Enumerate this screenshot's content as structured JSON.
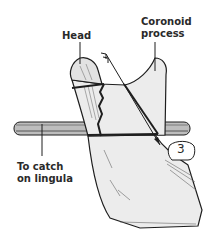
{
  "figure": {
    "labels": {
      "head": "Head",
      "coronoid_line1": "Coronoid",
      "coronoid_line2": "process",
      "catch_line1": "To catch",
      "catch_line2": "on lingula"
    },
    "tooth_number": "3",
    "colors": {
      "bone_fill": "#ececec",
      "outline": "#1e1e1e",
      "rod_fill": "#b8b8b8",
      "label_text": "#2a2a2a"
    }
  }
}
